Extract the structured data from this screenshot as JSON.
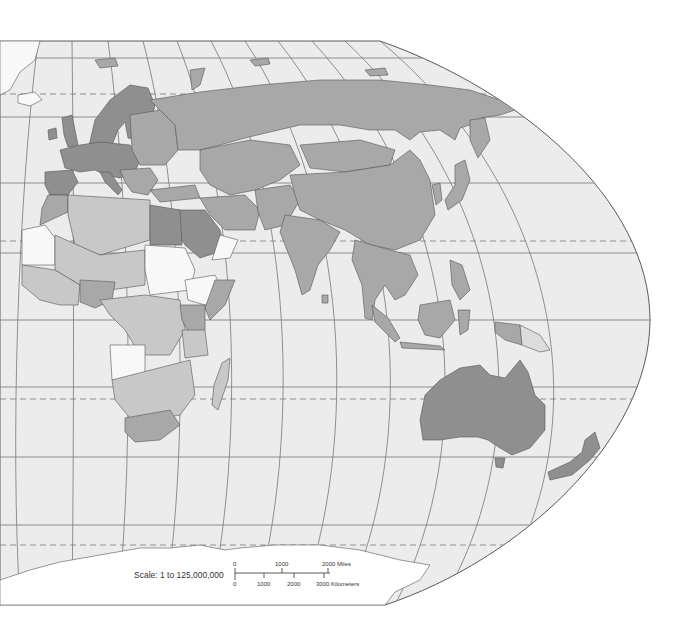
{
  "map": {
    "type": "world-political-map",
    "region": "Eastern Hemisphere (Europe, Africa, Asia, Oceania)",
    "projection_frame": "Robinson-style curved right edge",
    "colors": {
      "background": "#ffffff",
      "ocean": "#ececec",
      "land_dark": "#8f8f8f",
      "land_medium": "#a8a8a8",
      "land_light": "#c8c8c8",
      "land_lighter": "#dcdcdc",
      "land_white": "#f8f8f8",
      "graticule": "#777777",
      "frame": "#5a5a5a"
    },
    "graticule": {
      "solid_latitudes_y": [
        58,
        117,
        183,
        253,
        320,
        387,
        457,
        525
      ],
      "dashed_latitudes_y": [
        94,
        241,
        399,
        545
      ],
      "dashed_meaning": [
        "Arctic Circle",
        "Tropic of Cancer",
        "Tropic of Capricorn",
        "Antarctic Circle"
      ]
    }
  },
  "scale": {
    "label": "Scale:  1 to 125,000,000",
    "miles_ticks": [
      "0",
      "1000",
      "2000 Miles"
    ],
    "km_ticks": [
      "0",
      "1000",
      "2000",
      "3000 Kilometers"
    ]
  }
}
